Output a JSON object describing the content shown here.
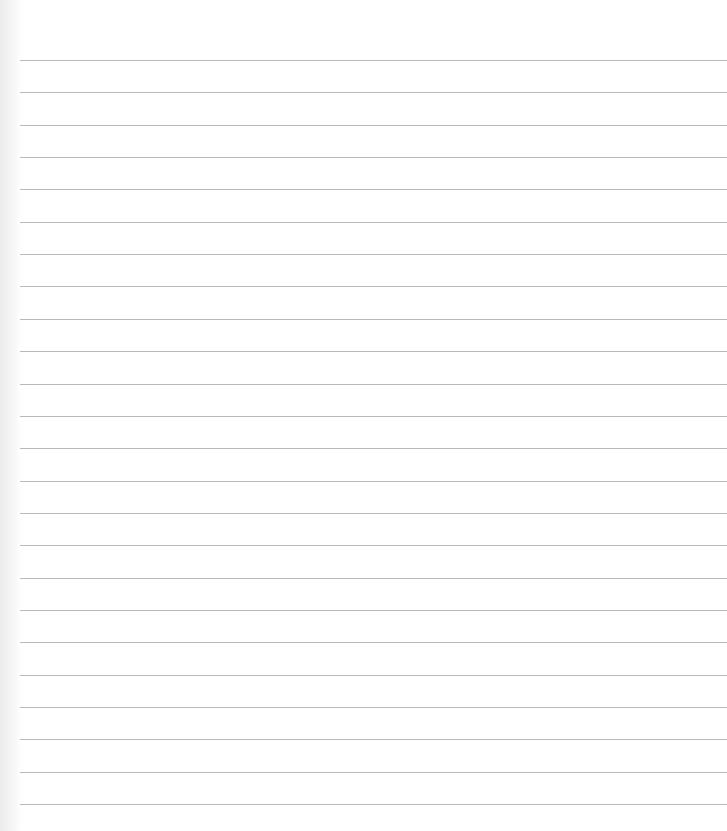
{
  "page": {
    "type": "blank lined paper",
    "background_color": "#ffffff",
    "line_color": "#b9b9b9",
    "line_count": 24,
    "first_line_y": 60,
    "line_spacing": 32.35
  }
}
